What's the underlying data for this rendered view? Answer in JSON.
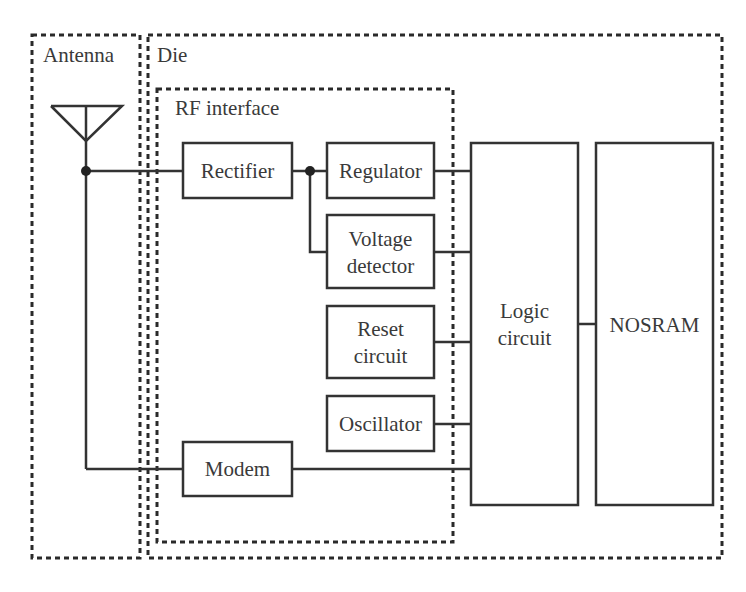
{
  "diagram": {
    "regions": {
      "antenna": "Antenna",
      "die": "Die",
      "rf_interface": "RF interface"
    },
    "blocks": {
      "rectifier": [
        "Rectifier"
      ],
      "regulator": [
        "Regulator"
      ],
      "voltage_detector": [
        "Voltage",
        "detector"
      ],
      "reset_circuit": [
        "Reset",
        "circuit"
      ],
      "oscillator": [
        "Oscillator"
      ],
      "modem": [
        "Modem"
      ],
      "logic_circuit": [
        "Logic",
        "circuit"
      ],
      "nosram": [
        "NOSRAM"
      ]
    },
    "connections": [
      {
        "from": "Antenna",
        "to": "Rectifier"
      },
      {
        "from": "Antenna",
        "to": "Modem"
      },
      {
        "from": "Rectifier",
        "to": "Regulator"
      },
      {
        "from": "Rectifier",
        "to": "Voltage detector"
      },
      {
        "from": "Regulator",
        "to": "Logic circuit"
      },
      {
        "from": "Voltage detector",
        "to": "Logic circuit"
      },
      {
        "from": "Reset circuit",
        "to": "Logic circuit"
      },
      {
        "from": "Oscillator",
        "to": "Logic circuit"
      },
      {
        "from": "Modem",
        "to": "Logic circuit"
      },
      {
        "from": "Logic circuit",
        "to": "NOSRAM"
      }
    ]
  }
}
